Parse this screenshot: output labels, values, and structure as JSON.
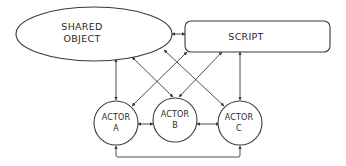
{
  "diagram": {
    "nodes": {
      "shared_object": {
        "line1": "SHARED",
        "line2": "OBJECT",
        "shape": "ellipse"
      },
      "script": {
        "label": "SCRIPT",
        "shape": "rounded-rectangle"
      },
      "actor_a": {
        "line1": "ACTOR",
        "line2": "A",
        "shape": "circle"
      },
      "actor_b": {
        "line1": "ACTOR",
        "line2": "B",
        "shape": "circle"
      },
      "actor_c": {
        "line1": "ACTOR",
        "line2": "C",
        "shape": "circle"
      }
    },
    "edges": [
      {
        "from": "shared_object",
        "to": "script",
        "direction": "both"
      },
      {
        "from": "shared_object",
        "to": "actor_a",
        "direction": "both"
      },
      {
        "from": "shared_object",
        "to": "actor_b",
        "direction": "both"
      },
      {
        "from": "shared_object",
        "to": "actor_c",
        "direction": "both"
      },
      {
        "from": "script",
        "to": "actor_a",
        "direction": "both"
      },
      {
        "from": "script",
        "to": "actor_b",
        "direction": "both"
      },
      {
        "from": "script",
        "to": "actor_c",
        "direction": "both"
      },
      {
        "from": "actor_a",
        "to": "actor_b",
        "direction": "both"
      },
      {
        "from": "actor_b",
        "to": "actor_c",
        "direction": "both"
      },
      {
        "from": "actor_a",
        "to": "actor_c",
        "direction": "both"
      }
    ],
    "stroke_color": "#3a3a3a",
    "background": "#ffffff"
  }
}
